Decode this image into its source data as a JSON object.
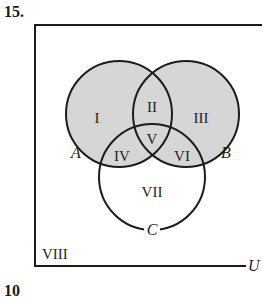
{
  "problem": {
    "number": "15.",
    "next_number_partial": "10"
  },
  "diagram": {
    "type": "venn-3-set",
    "universe_label": "U",
    "sets": [
      {
        "label": "A",
        "cx": 119,
        "cy": 114,
        "r": 53,
        "shaded": true
      },
      {
        "label": "B",
        "cx": 186,
        "cy": 114,
        "r": 53,
        "shaded": true
      },
      {
        "label": "C",
        "cx": 152,
        "cy": 177,
        "r": 53,
        "shaded": false
      }
    ],
    "regions": [
      {
        "id": "I",
        "label": "I",
        "x": 97,
        "y": 118,
        "shaded": true
      },
      {
        "id": "II",
        "label": "II",
        "x": 152,
        "y": 107,
        "shaded": true
      },
      {
        "id": "III",
        "label": "III",
        "x": 199,
        "y": 118,
        "shaded": true
      },
      {
        "id": "IV",
        "label": "IV",
        "x": 122,
        "y": 158,
        "shaded": true
      },
      {
        "id": "V",
        "label": "V",
        "x": 152,
        "y": 140,
        "shaded": true
      },
      {
        "id": "VI",
        "label": "VI",
        "x": 182,
        "y": 158,
        "shaded": true
      },
      {
        "id": "VII",
        "label": "VII",
        "x": 152,
        "y": 193,
        "shaded": false
      },
      {
        "id": "VIII",
        "label": "VIII",
        "x": 58,
        "y": 255,
        "shaded": false
      }
    ],
    "colors": {
      "shade": "#d6d6d6",
      "stroke": "#1c1c1c",
      "background": "#ffffff"
    }
  }
}
